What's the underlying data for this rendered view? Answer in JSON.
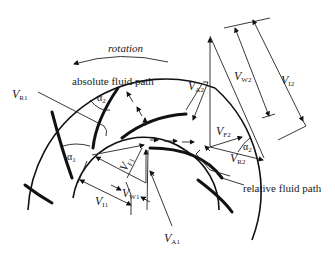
{
  "diagram": {
    "labels": {
      "rotation": "rotation",
      "absolute_path": "absolute fluid path",
      "relative_path": "relative fluid path",
      "VR1": {
        "main": "V",
        "sub": "R1"
      },
      "VA2": {
        "main": "V",
        "sub": "A2"
      },
      "VW2": {
        "main": "V",
        "sub": "W2"
      },
      "VI2": {
        "main": "V",
        "sub": "I2"
      },
      "VF2": {
        "main": "V",
        "sub": "F2"
      },
      "VR2": {
        "main": "V",
        "sub": "R2"
      },
      "VF1": {
        "main": "V",
        "sub": "F1"
      },
      "VW1": {
        "main": "V",
        "sub": "W1"
      },
      "VI1": {
        "main": "V",
        "sub": "I1"
      },
      "VA1": {
        "main": "V",
        "sub": "A1"
      },
      "alpha1": {
        "main": "α",
        "sub": "1"
      },
      "alpha2_top": {
        "main": "α",
        "sub": "2"
      },
      "alpha2_right": {
        "main": "α",
        "sub": "2"
      }
    }
  }
}
